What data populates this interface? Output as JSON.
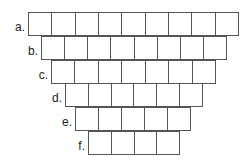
{
  "diagram": {
    "line_color": "#555555",
    "rows": [
      {
        "label": "a.",
        "cells": 9,
        "left": 28,
        "top": 12,
        "width": 211
      },
      {
        "label": "b.",
        "cells": 8,
        "left": 41,
        "top": 36,
        "width": 186
      },
      {
        "label": "c.",
        "cells": 7,
        "left": 51,
        "top": 60,
        "width": 165
      },
      {
        "label": "d.",
        "cells": 6,
        "left": 65,
        "top": 83,
        "width": 138
      },
      {
        "label": "e.",
        "cells": 5,
        "left": 75,
        "top": 107,
        "width": 116
      },
      {
        "label": "f.",
        "cells": 4,
        "left": 88,
        "top": 131,
        "width": 92
      }
    ]
  }
}
